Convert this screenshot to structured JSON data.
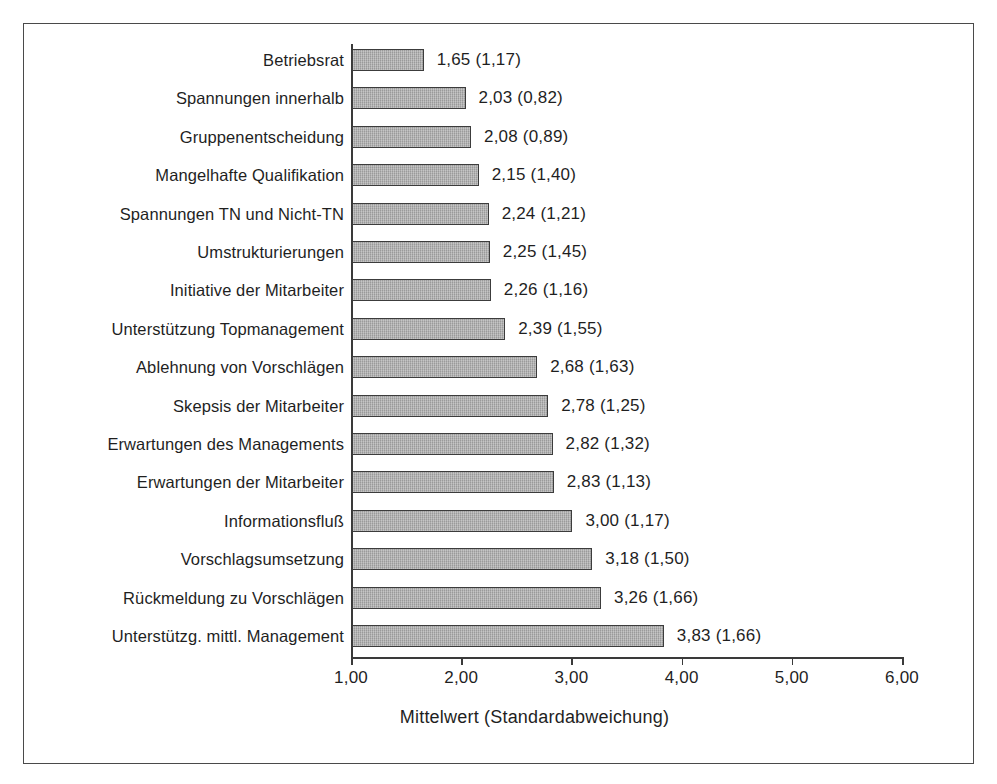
{
  "chart_data": {
    "type": "bar",
    "orientation": "horizontal",
    "title": "",
    "xlabel": "Mittelwert (Standardabweichung)",
    "ylabel": "",
    "xlim": [
      1.0,
      6.0
    ],
    "xticks": [
      "1,00",
      "2,00",
      "3,00",
      "4,00",
      "5,00",
      "6,00"
    ],
    "xtick_values": [
      1.0,
      2.0,
      3.0,
      4.0,
      5.0,
      6.0
    ],
    "grid": false,
    "legend": null,
    "bar_color": "#a9a9a9",
    "bar_border_color": "#3c3c3c",
    "axis_color": "#3a3a3a",
    "categories": [
      "Betriebsrat",
      "Spannungen innerhalb",
      "Gruppenentscheidung",
      "Mangelhafte Qualifikation",
      "Spannungen TN und Nicht-TN",
      "Umstrukturierungen",
      "Initiative der Mitarbeiter",
      "Unterstützung Topmanagement",
      "Ablehnung von Vorschlägen",
      "Skepsis der Mitarbeiter",
      "Erwartungen des Managements",
      "Erwartungen der Mitarbeiter",
      "Informationsfluß",
      "Vorschlagsumsetzung",
      "Rückmeldung zu Vorschlägen",
      "Unterstützg. mittl. Management"
    ],
    "values": [
      1.65,
      2.03,
      2.08,
      2.15,
      2.24,
      2.25,
      2.26,
      2.39,
      2.68,
      2.78,
      2.82,
      2.83,
      3.0,
      3.18,
      3.26,
      3.83
    ],
    "std_devs": [
      1.17,
      0.82,
      0.89,
      1.4,
      1.21,
      1.45,
      1.16,
      1.55,
      1.63,
      1.25,
      1.32,
      1.13,
      1.17,
      1.5,
      1.66,
      1.66
    ],
    "data_labels": [
      "1,65 (1,17)",
      "2,03 (0,82)",
      "2,08 (0,89)",
      "2,15 (1,40)",
      "2,24 (1,21)",
      "2,25 (1,45)",
      "2,26 (1,16)",
      "2,39 (1,55)",
      "2,68 (1,63)",
      "2,78 (1,25)",
      "2,82 (1,32)",
      "2,83 (1,13)",
      "3,00 (1,17)",
      "3,18 (1,50)",
      "3,26 (1,66)",
      "3,83 (1,66)"
    ]
  }
}
